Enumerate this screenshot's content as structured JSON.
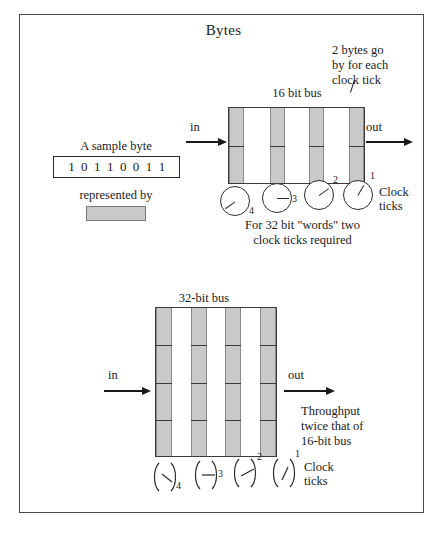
{
  "page": {
    "title": "Bytes",
    "background_color": "#ffffff",
    "frame_border_color": "#4a4a4a",
    "bar_fill_color": "#c9c9c9",
    "ink_color": "#1a1a1a"
  },
  "legend": {
    "sample_label": "A sample byte",
    "byte_bits": "1 0 1 1 0 0 1 1",
    "represented_by_label": "represented by",
    "swatch_color": "#c9c9c9"
  },
  "bus16": {
    "label": "16 bit bus",
    "in_label": "in",
    "out_label": "out",
    "bar_count": 4,
    "segments_per_bar": 2,
    "callout": "2 bytes go\nby for each\nclock tick",
    "clock_ticks_label": "Clock\nticks",
    "clock_numbers": [
      "4",
      "3",
      "2",
      "1"
    ],
    "clock_hand_angles_deg": [
      145,
      0,
      -35,
      -60
    ],
    "caption": "For 32 bit \"words\" two\nclock ticks required"
  },
  "bus32": {
    "label": "32-bit bus",
    "in_label": "in",
    "out_label": "out",
    "bar_count": 4,
    "segments_per_bar": 4,
    "note": "Throughput\ntwice that of\n16-bit bus",
    "clock_ticks_label": "Clock\nticks",
    "clock_numbers": [
      "4",
      "3",
      "2",
      "1"
    ],
    "clock_hand_angles_deg": [
      35,
      0,
      -25,
      -60
    ]
  }
}
